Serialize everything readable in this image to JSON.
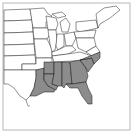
{
  "map": {
    "title": "",
    "region": "Eastern United States",
    "range_color": "#8c8c8c",
    "background_color": "#ffffff",
    "border_color": "#b8b8b8",
    "shaded_regions": [
      "East Texas",
      "Louisiana",
      "Arkansas",
      "Mississippi",
      "Alabama",
      "Georgia",
      "Florida",
      "South Carolina",
      "North Carolina",
      "Southern Tennessee"
    ]
  }
}
